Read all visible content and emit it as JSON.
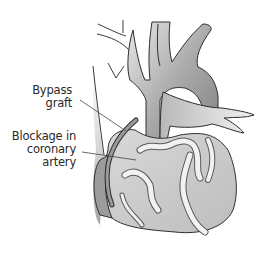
{
  "diagram": {
    "labels": {
      "bypass_graft": {
        "line1": "Bypass",
        "line2": "graft"
      },
      "blockage": {
        "line1": "Blockage in",
        "line2": "coronary",
        "line3": "artery"
      }
    },
    "colors": {
      "background": "#ffffff",
      "outline": "#3a3a3a",
      "vessel_dark": "#8a8a8a",
      "vessel_light": "#e6e6e6",
      "heart_fill": "#c8c8c8",
      "artery_fill": "#efefef",
      "graft_fill": "#9a9a9a",
      "leader_line": "#444444"
    }
  }
}
